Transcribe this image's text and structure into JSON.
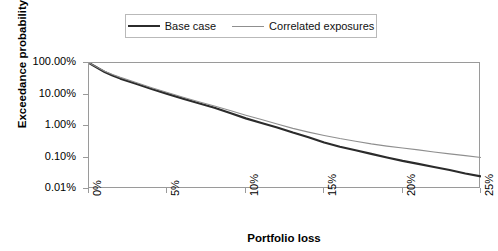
{
  "chart_data": {
    "type": "line",
    "title": "",
    "xlabel": "Portfolio loss",
    "ylabel": "Exceedance probability",
    "yscale": "log",
    "ylim": [
      0.0001,
      1.0
    ],
    "xlim": [
      0,
      25
    ],
    "grid": false,
    "legend_position": "top-center",
    "y_tick_labels": [
      "100.00%",
      "10.00%",
      "1.00%",
      "0.10%",
      "0.01%"
    ],
    "y_tick_values": [
      100,
      10,
      1,
      0.1,
      0.01
    ],
    "x_tick_labels": [
      "0%",
      "5%",
      "10%",
      "15%",
      "20%",
      "25%"
    ],
    "x_tick_values": [
      0,
      5,
      10,
      15,
      20,
      25
    ],
    "series": [
      {
        "name": "Base case",
        "color": "#2b2b2b",
        "width": 2.2,
        "x": [
          0,
          0.5,
          1,
          1.5,
          2,
          3,
          4,
          5,
          6,
          7,
          8,
          9,
          10,
          11,
          12,
          13,
          14,
          15,
          16,
          17,
          18,
          19,
          20,
          21,
          22,
          23,
          24,
          25
        ],
        "values": [
          100,
          72,
          52,
          40,
          32,
          22,
          15,
          10.5,
          7.4,
          5.3,
          3.8,
          2.6,
          1.75,
          1.25,
          0.9,
          0.62,
          0.44,
          0.3,
          0.22,
          0.17,
          0.13,
          0.1,
          0.078,
          0.063,
          0.05,
          0.04,
          0.031,
          0.025
        ]
      },
      {
        "name": "Correlated exposures",
        "color": "#8f8f8f",
        "width": 1.1,
        "x": [
          0,
          0.5,
          1,
          1.5,
          2,
          3,
          4,
          5,
          6,
          7,
          8,
          9,
          10,
          11,
          12,
          13,
          14,
          15,
          16,
          17,
          18,
          19,
          20,
          21,
          22,
          23,
          24,
          25
        ],
        "values": [
          100,
          74,
          55,
          43,
          35,
          24,
          16.5,
          11.5,
          8.2,
          5.9,
          4.3,
          3.1,
          2.2,
          1.6,
          1.15,
          0.84,
          0.64,
          0.5,
          0.4,
          0.33,
          0.27,
          0.23,
          0.2,
          0.175,
          0.15,
          0.13,
          0.115,
          0.1
        ]
      }
    ]
  },
  "legend": {
    "entries": [
      {
        "label": "Base case"
      },
      {
        "label": "Correlated exposures"
      }
    ]
  }
}
